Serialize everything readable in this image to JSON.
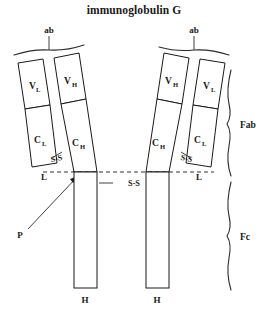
{
  "figure": {
    "title": "immunoglobulin G",
    "background_color": "#ffffff",
    "line_color": "#1a1a1a"
  },
  "antigen_binding_labels": {
    "left": "ab",
    "right": "ab"
  },
  "left_arm": {
    "light_chain": {
      "variable_domain": {
        "symbol": "V",
        "subscript": "L"
      },
      "constant_domain": {
        "symbol": "C",
        "subscript": "L"
      },
      "chain_label": "L"
    },
    "heavy_chain": {
      "variable_domain": {
        "symbol": "V",
        "subscript": "H"
      },
      "constant_domain": {
        "symbol": "C",
        "subscript": "H"
      }
    },
    "disulfide_label": "S-S"
  },
  "right_arm": {
    "light_chain": {
      "variable_domain": {
        "symbol": "V",
        "subscript": "L"
      },
      "constant_domain": {
        "symbol": "C",
        "subscript": "L"
      },
      "chain_label": "L"
    },
    "heavy_chain": {
      "variable_domain": {
        "symbol": "V",
        "subscript": "H"
      },
      "constant_domain": {
        "symbol": "C",
        "subscript": "H"
      }
    },
    "disulfide_label": "S-S"
  },
  "hinge": {
    "disulfide_label": "S-S",
    "papain_label": "P"
  },
  "heavy_chain_labels": {
    "left": "H",
    "right": "H"
  },
  "region_brackets": {
    "fab": "Fab",
    "fc": "Fc"
  }
}
